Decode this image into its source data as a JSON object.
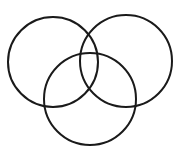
{
  "diagram": {
    "type": "venn",
    "stroke_color": "#1a1a1a",
    "background": "#ffffff",
    "circles": [
      {
        "name": "left",
        "cx": 53,
        "cy": 62,
        "r": 45
      },
      {
        "name": "right",
        "cx": 126,
        "cy": 61,
        "r": 46
      },
      {
        "name": "bottom",
        "cx": 90,
        "cy": 99,
        "r": 46
      }
    ]
  }
}
